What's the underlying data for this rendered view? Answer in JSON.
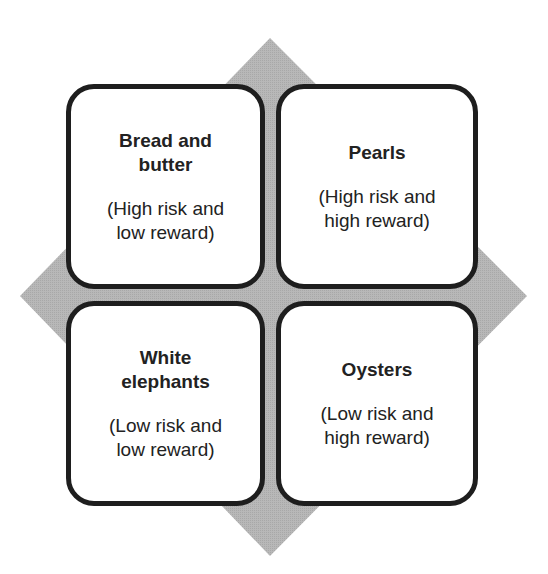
{
  "diagram": {
    "background_shape": "diamond",
    "colors": {
      "diamond": "#b4b4b4",
      "border": "#1e1e1e",
      "box": "#ffffff",
      "text": "#222222"
    },
    "quadrants": [
      {
        "position": "top-left",
        "title_line1": "Bread and",
        "title_line2": "butter",
        "desc_line1": "(High risk and",
        "desc_line2": "low reward)"
      },
      {
        "position": "top-right",
        "title_line1": "Pearls",
        "title_line2": "",
        "desc_line1": "(High risk and",
        "desc_line2": "high reward)"
      },
      {
        "position": "bottom-left",
        "title_line1": "White",
        "title_line2": "elephants",
        "desc_line1": "(Low risk and",
        "desc_line2": "low reward)"
      },
      {
        "position": "bottom-right",
        "title_line1": "Oysters",
        "title_line2": "",
        "desc_line1": "(Low risk and",
        "desc_line2": "high reward)"
      }
    ]
  }
}
